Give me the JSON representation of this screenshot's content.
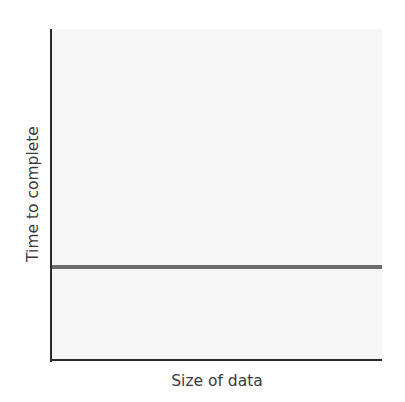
{
  "chart_data": {
    "type": "line",
    "title": "",
    "xlabel": "Size of data",
    "ylabel": "Time to complete",
    "x": [
      0,
      1
    ],
    "series": [
      {
        "name": "constant time",
        "values": [
          0.28,
          0.28
        ],
        "color": "#6b6b6b"
      }
    ],
    "xlim": [
      0,
      1
    ],
    "ylim": [
      0,
      1
    ],
    "grid": false,
    "ticks": false,
    "legend": null
  },
  "colors": {
    "axis": "#2a2a2a",
    "plot_background": "#f6f6f6",
    "series_line": "#6b6b6b"
  }
}
